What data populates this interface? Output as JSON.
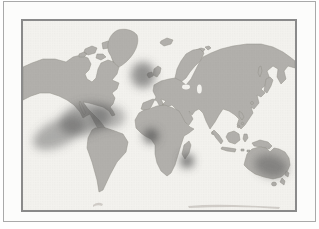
{
  "page": {
    "background_color": "#fefefe"
  },
  "frame": {
    "outer_border_color": "#a9a9a9",
    "matte_color": "#fcfcfb",
    "panel_border_color": "#8a8a8a"
  },
  "map": {
    "kind": "scanned grayscale halftone world map with airbrushed shaded regions",
    "ocean_color": "#f3f2ee",
    "land_color": "#b2b0ac",
    "land_edge_color": "#94928b",
    "antarctica_edge_color": "#cdcac4",
    "shade_color": "#565656",
    "landmasses": [
      "north-america",
      "baja-california",
      "arctic-islands",
      "greenland",
      "iceland",
      "svalbard",
      "british-isles",
      "ireland",
      "scandinavia",
      "eurasia",
      "africa",
      "madagascar",
      "sri-lanka",
      "japan",
      "sakhalin",
      "taiwan",
      "philippines",
      "sumatra",
      "borneo",
      "sulawesi",
      "java",
      "lesser-sunda-islands",
      "new-guinea",
      "south-america",
      "australia",
      "tasmania",
      "new-zealand",
      "antarctica-edge"
    ],
    "shaded_regions": [
      {
        "name": "gulf-of-mexico-caribbean",
        "cx": 62,
        "cy": 98,
        "rx": 26,
        "ry": 16,
        "rotate": -15,
        "opacity": 0.5
      },
      {
        "name": "eastern-pacific-off-mexico",
        "cx": 36,
        "cy": 112,
        "rx": 28,
        "ry": 13,
        "rotate": -25,
        "opacity": 0.45
      },
      {
        "name": "western-north-atlantic",
        "cx": 84,
        "cy": 96,
        "rx": 18,
        "ry": 12,
        "rotate": 0,
        "opacity": 0.4
      },
      {
        "name": "north-atlantic-near-british-isles",
        "cx": 120,
        "cy": 54,
        "rx": 12,
        "ry": 13,
        "rotate": 0,
        "opacity": 0.6
      },
      {
        "name": "gulf-of-guinea",
        "cx": 128,
        "cy": 115,
        "rx": 7.5,
        "ry": 7.5,
        "rotate": 0,
        "opacity": 0.8
      },
      {
        "name": "southwest-indian-ocean-madagascar",
        "cx": 164,
        "cy": 140,
        "rx": 7,
        "ry": 7,
        "rotate": 0,
        "opacity": 0.8
      },
      {
        "name": "coral-sea-eastern-australia",
        "cx": 248,
        "cy": 145,
        "rx": 17,
        "ry": 11,
        "rotate": 15,
        "opacity": 0.5
      }
    ]
  }
}
